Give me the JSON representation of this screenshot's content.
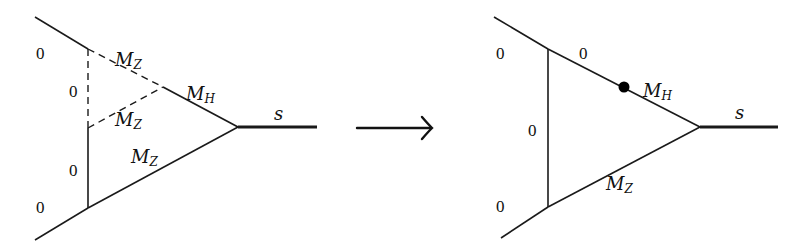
{
  "diagram": {
    "type": "feynman-diagram-reduction",
    "arrow": {
      "glyph": "→",
      "meaning": "reduces-to"
    },
    "left": {
      "description": "Two-loop vertex diagram",
      "external_labels": {
        "top": "0",
        "bottom": "0"
      },
      "internal_labels": {
        "dashed_vertical": "0",
        "solid_vertical": "0",
        "dashed_top_diagonal": {
          "base": "M",
          "sub": "Z"
        },
        "dashed_inner_diagonal": {
          "base": "M",
          "sub": "Z"
        },
        "solid_top_diagonal": {
          "base": "M",
          "sub": "H"
        },
        "solid_bottom_diagonal": {
          "base": "M",
          "sub": "Z"
        }
      },
      "outgoing": "s"
    },
    "right": {
      "description": "One-loop vertex diagram with a dot on the top line",
      "external_labels": {
        "top": "0",
        "bottom": "0"
      },
      "internal_labels": {
        "vertical": "0",
        "top_diagonal_left": "0",
        "top_diagonal_right": {
          "base": "M",
          "sub": "H"
        },
        "bottom_diagonal": {
          "base": "M",
          "sub": "Z"
        }
      },
      "dot": "propagator-dot",
      "outgoing": "s"
    }
  }
}
